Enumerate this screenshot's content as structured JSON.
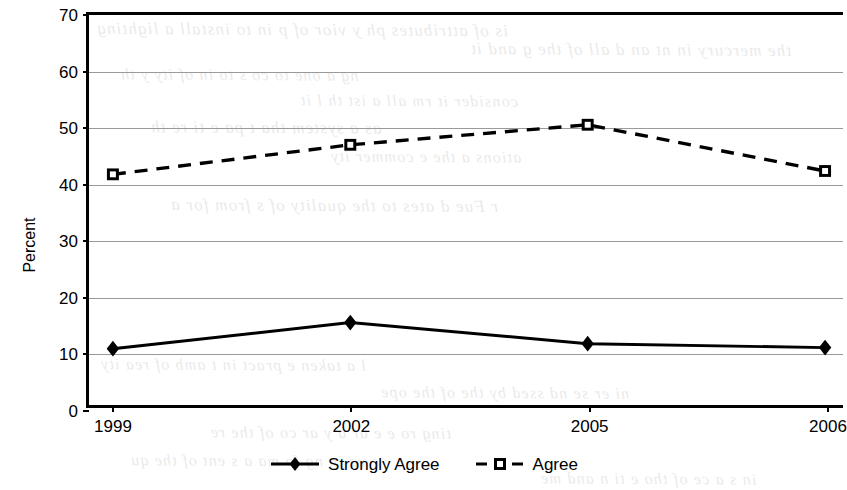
{
  "chart_data": {
    "type": "line",
    "title": "",
    "subtitle": "",
    "xlabel": "",
    "ylabel": "Percent",
    "categories": [
      "1999",
      "2002",
      "2005",
      "2006"
    ],
    "x": [
      1999,
      2002,
      2005,
      2006
    ],
    "ylim": [
      0,
      70
    ],
    "ytick_step": 10,
    "yticks": [
      "70",
      "60",
      "50",
      "40",
      "30",
      "20",
      "10",
      "0"
    ],
    "ytick_values": [
      70,
      60,
      50,
      40,
      30,
      20,
      10,
      0
    ],
    "grid": "horizontal",
    "legend_position": "bottom-center",
    "series": [
      {
        "name": "Strongly Agree",
        "values": [
          10.1,
          14.8,
          11.0,
          10.3
        ],
        "line_style": "solid",
        "marker": "filled-diamond",
        "color": "#000000"
      },
      {
        "name": "Agree",
        "values": [
          41.4,
          46.7,
          50.3,
          42.0
        ],
        "line_style": "dashed",
        "marker": "hollow-square",
        "color": "#000000"
      }
    ]
  },
  "legend": {
    "entries": [
      {
        "label": "Strongly Agree",
        "marker": "filled-diamond",
        "line_style": "solid"
      },
      {
        "label": "Agree",
        "marker": "hollow-square",
        "line_style": "dashed"
      }
    ]
  },
  "axes": {
    "y_title": "Percent"
  },
  "scan_bleed": {
    "lines": [
      {
        "text": "is of attributes ph  y  vior of  p  in to install a lighting",
        "x": 96,
        "y": 20,
        "size": 17
      },
      {
        "text": "the mercury in  nt an  d  all of the  g  and it",
        "x": 470,
        "y": 40,
        "size": 17
      },
      {
        "text": "ng a one to co  s  to  in  of  ity  y  th",
        "x": 120,
        "y": 66,
        "size": 16
      },
      {
        "text": "consider it  rm  all a  ist th  l  it",
        "x": 300,
        "y": 92,
        "size": 16
      },
      {
        "text": "as a system  tha  t  pa  e  ti  re  th",
        "x": 150,
        "y": 118,
        "size": 17
      },
      {
        "text": "ations  a  the  e  commer  ity",
        "x": 330,
        "y": 148,
        "size": 16
      },
      {
        "text": "r  Fue  d  ates  to the quality of  s  from  for  a",
        "x": 170,
        "y": 196,
        "size": 17
      },
      {
        "text": "l  a  taken  e  pract  in  t  amb  of  rea  ity",
        "x": 100,
        "y": 356,
        "size": 16
      },
      {
        "text": "ni  er  se  nd  ssed  by  the  of  the  ope",
        "x": 380,
        "y": 384,
        "size": 16
      },
      {
        "text": "ting  ro  e  e  ar  a  y  ar  co  of  the  re",
        "x": 210,
        "y": 424,
        "size": 16
      },
      {
        "text": "e  va  in  ng  fo  ma  a  s  ent  of  the  qu",
        "x": 130,
        "y": 452,
        "size": 16
      },
      {
        "text": "in  s  a  ce  of  tho  e  ti  n  and  me",
        "x": 540,
        "y": 470,
        "size": 16
      }
    ]
  }
}
